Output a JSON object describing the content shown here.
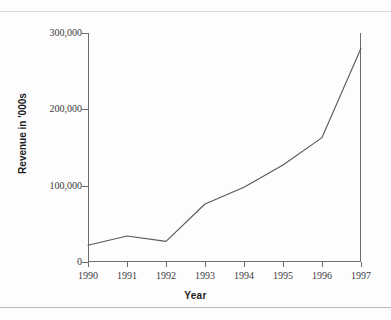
{
  "page": {
    "top_caption": "",
    "background_color": "#fdfdfd",
    "rule_color": "#c9c9cb"
  },
  "chart_data": {
    "type": "line",
    "title": "",
    "xlabel": "Year",
    "ylabel": "Revenue in '000s",
    "categories": [
      "1990",
      "1991",
      "1992",
      "1993",
      "1994",
      "1995",
      "1996",
      "1997"
    ],
    "values": [
      22000,
      34000,
      27000,
      76000,
      98000,
      127000,
      163000,
      280000
    ],
    "x": [
      1990,
      1991,
      1992,
      1993,
      1994,
      1995,
      1996,
      1997
    ],
    "ylim": [
      0,
      300000
    ],
    "ytick_labels": [
      "0",
      "100,000",
      "200,000",
      "300,000"
    ],
    "ytick_values": [
      0,
      100000,
      200000,
      300000
    ],
    "xtick_labels": [
      "1990",
      "1991",
      "1992",
      "1993",
      "1994",
      "1995",
      "1996",
      "1997"
    ],
    "grid": false,
    "legend": false,
    "legend_position": "none",
    "series": [
      {
        "name": "Revenue",
        "color": "#58585c",
        "values": [
          22000,
          34000,
          27000,
          76000,
          98000,
          127000,
          163000,
          280000
        ]
      }
    ]
  }
}
